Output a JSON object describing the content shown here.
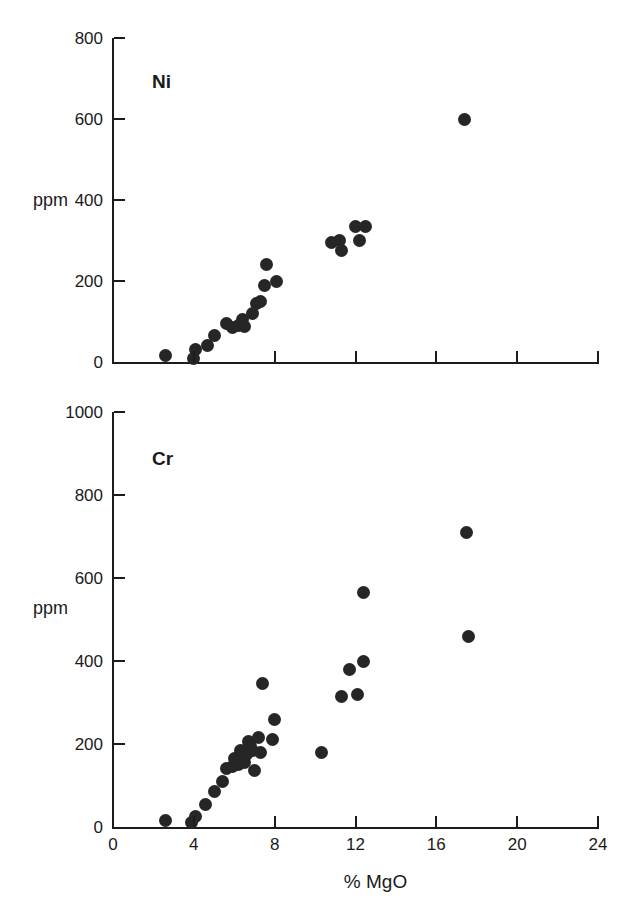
{
  "figure": {
    "xlabel": "% MgO",
    "ylabel_ni": "ppm",
    "ylabel_cr": "ppm"
  },
  "chart_data": [
    {
      "type": "scatter",
      "title": "Ni",
      "xlabel": "% MgO",
      "ylabel": "ppm",
      "xlim": [
        0,
        24
      ],
      "ylim": [
        0,
        800
      ],
      "xticks": [
        0,
        4,
        8,
        12,
        16,
        20,
        24
      ],
      "xticklabels": [
        "",
        "",
        "",
        "",
        "",
        "",
        ""
      ],
      "yticks": [
        0,
        200,
        400,
        600,
        800
      ],
      "yticklabels": [
        "0",
        "200",
        "400",
        "600",
        "800"
      ],
      "grid": false,
      "legend": false,
      "marker": "filled-circle",
      "marker_color": "#262626",
      "points": [
        {
          "x": 2.6,
          "y": 15
        },
        {
          "x": 4.0,
          "y": 8
        },
        {
          "x": 4.1,
          "y": 30
        },
        {
          "x": 4.7,
          "y": 40
        },
        {
          "x": 5.0,
          "y": 65
        },
        {
          "x": 5.6,
          "y": 95
        },
        {
          "x": 5.9,
          "y": 85
        },
        {
          "x": 6.2,
          "y": 90
        },
        {
          "x": 6.4,
          "y": 105
        },
        {
          "x": 6.5,
          "y": 88
        },
        {
          "x": 6.9,
          "y": 120
        },
        {
          "x": 7.1,
          "y": 145
        },
        {
          "x": 7.3,
          "y": 150
        },
        {
          "x": 7.5,
          "y": 190
        },
        {
          "x": 7.6,
          "y": 240
        },
        {
          "x": 8.1,
          "y": 200
        },
        {
          "x": 10.8,
          "y": 295
        },
        {
          "x": 11.2,
          "y": 300
        },
        {
          "x": 11.3,
          "y": 275
        },
        {
          "x": 12.0,
          "y": 335
        },
        {
          "x": 12.2,
          "y": 300
        },
        {
          "x": 12.5,
          "y": 335
        },
        {
          "x": 17.4,
          "y": 600
        }
      ]
    },
    {
      "type": "scatter",
      "title": "Cr",
      "xlabel": "% MgO",
      "ylabel": "ppm",
      "xlim": [
        0,
        24
      ],
      "ylim": [
        0,
        1000
      ],
      "xticks": [
        0,
        4,
        8,
        12,
        16,
        20,
        24
      ],
      "xticklabels": [
        "0",
        "4",
        "8",
        "12",
        "16",
        "20",
        "24"
      ],
      "yticks": [
        0,
        200,
        400,
        600,
        800,
        1000
      ],
      "yticklabels": [
        "0",
        "200",
        "400",
        "600",
        "800",
        "1000"
      ],
      "grid": false,
      "legend": false,
      "marker": "filled-circle",
      "marker_color": "#262626",
      "points": [
        {
          "x": 2.6,
          "y": 15
        },
        {
          "x": 3.9,
          "y": 10
        },
        {
          "x": 4.1,
          "y": 25
        },
        {
          "x": 4.6,
          "y": 55
        },
        {
          "x": 5.0,
          "y": 85
        },
        {
          "x": 5.4,
          "y": 110
        },
        {
          "x": 5.6,
          "y": 140
        },
        {
          "x": 5.9,
          "y": 145
        },
        {
          "x": 6.0,
          "y": 165
        },
        {
          "x": 6.2,
          "y": 150
        },
        {
          "x": 6.3,
          "y": 185
        },
        {
          "x": 6.4,
          "y": 160
        },
        {
          "x": 6.5,
          "y": 155
        },
        {
          "x": 6.6,
          "y": 175
        },
        {
          "x": 6.7,
          "y": 205
        },
        {
          "x": 6.8,
          "y": 195
        },
        {
          "x": 6.9,
          "y": 185
        },
        {
          "x": 7.0,
          "y": 135
        },
        {
          "x": 7.2,
          "y": 215
        },
        {
          "x": 7.3,
          "y": 180
        },
        {
          "x": 7.4,
          "y": 345
        },
        {
          "x": 7.9,
          "y": 210
        },
        {
          "x": 8.0,
          "y": 260
        },
        {
          "x": 10.3,
          "y": 180
        },
        {
          "x": 11.3,
          "y": 315
        },
        {
          "x": 11.7,
          "y": 380
        },
        {
          "x": 12.1,
          "y": 320
        },
        {
          "x": 12.4,
          "y": 400
        },
        {
          "x": 12.4,
          "y": 565
        },
        {
          "x": 17.5,
          "y": 710
        },
        {
          "x": 17.6,
          "y": 460
        }
      ]
    }
  ]
}
